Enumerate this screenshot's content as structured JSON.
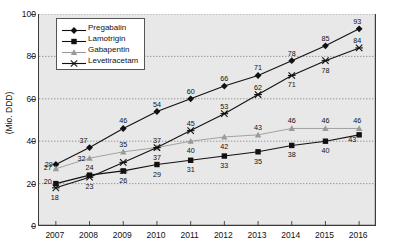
{
  "chart_data": {
    "type": "line",
    "title": "",
    "xlabel": "",
    "ylabel": "(Mio. DDD)",
    "categories": [
      "2007",
      "2008",
      "2009",
      "2010",
      "2011",
      "2012",
      "2013",
      "2014",
      "2015",
      "2016"
    ],
    "x": [
      2007,
      2008,
      2009,
      2010,
      2011,
      2012,
      2013,
      2014,
      2015,
      2016
    ],
    "ylim": [
      0,
      100
    ],
    "yticks": [
      0,
      20,
      40,
      60,
      80,
      100
    ],
    "grid": true,
    "legend_position": "top-left",
    "series": [
      {
        "name": "Pregabalin",
        "marker": "diamond",
        "color": "#111111",
        "values": [
          29,
          37,
          46,
          54,
          60,
          66,
          71,
          78,
          85,
          93
        ]
      },
      {
        "name": "Lamotrigin",
        "marker": "square",
        "color": "#111111",
        "values": [
          20,
          24,
          26,
          29,
          31,
          33,
          35,
          38,
          40,
          43
        ]
      },
      {
        "name": "Gabapentin",
        "marker": "triangle",
        "color": "#9a9a9a",
        "values": [
          27,
          32,
          35,
          37,
          40,
          42,
          43,
          46,
          46,
          46
        ]
      },
      {
        "name": "Levetiracetam",
        "marker": "cross",
        "color": "#111111",
        "values": [
          18,
          23,
          30,
          37,
          45,
          53,
          62,
          71,
          78,
          84
        ]
      }
    ]
  },
  "axes": {
    "y_label": "(Mio. DDD)",
    "y_ticks": [
      "0",
      "20",
      "40",
      "60",
      "80",
      "100"
    ],
    "x_ticks": [
      "2007",
      "2008",
      "2009",
      "2010",
      "2011",
      "2012",
      "2013",
      "2014",
      "2015",
      "2016"
    ]
  },
  "legend": {
    "items": [
      {
        "label": "Pregabalin"
      },
      {
        "label": "Lamotrigin"
      },
      {
        "label": "Gabapentin"
      },
      {
        "label": "Levetiracetam"
      }
    ]
  },
  "colors": {
    "plot_background": "#e8e8e8",
    "axis": "#3a3a3a",
    "grid": "#8d8d8d",
    "dark_series": "#111111",
    "gray_series": "#9a9a9a"
  }
}
